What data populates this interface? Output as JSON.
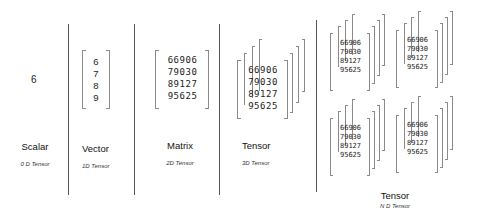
{
  "columns": [
    {
      "id": "scalar",
      "title": "Scalar",
      "subtitle": "0 D Tensor",
      "value": "6"
    },
    {
      "id": "vector",
      "title": "Vector",
      "subtitle": "1D Tensor",
      "values": [
        "6",
        "7",
        "8",
        "9"
      ]
    },
    {
      "id": "matrix",
      "title": "Matrix",
      "subtitle": "2D Tensor",
      "rows": [
        "66906",
        "79030",
        "89127",
        "95625"
      ]
    },
    {
      "id": "tensor3d",
      "title": "Tensor",
      "subtitle": "3D Tensor",
      "rows": [
        "66906",
        "79030",
        "89127",
        "95625"
      ]
    },
    {
      "id": "tensornd",
      "title": "Tensor",
      "subtitle": "N D Tensor",
      "rows": [
        "66906",
        "79030",
        "89127",
        "95625"
      ]
    }
  ],
  "colors": {
    "divider": "#555555",
    "bracket": "#8a8a8a",
    "text": "#1a1a1a"
  }
}
